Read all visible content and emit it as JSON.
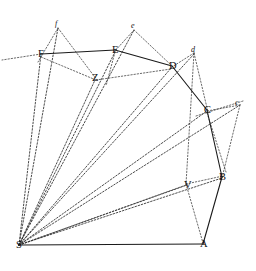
{
  "figure": {
    "width": 256,
    "height": 271,
    "background_color": "#ffffff",
    "stroke_color": "#1a1a1a"
  },
  "chart_data": {
    "type": "scatter",
    "title": "",
    "xlabel": "",
    "ylabel": "",
    "grid": false,
    "legend": "none",
    "xlim": [
      0,
      256
    ],
    "ylim": [
      0,
      271
    ],
    "note": "Planar geometric diagram: solid polygon S-A-B-C-D-E-F with dashed construction rays from apex S and auxiliary points Z, V and primed vertices c, d, e, f",
    "points": [
      {
        "label": "S",
        "case": "upper",
        "x": 19,
        "y": 245
      },
      {
        "label": "A",
        "case": "upper",
        "x": 203,
        "y": 244
      },
      {
        "label": "B",
        "case": "upper",
        "x": 222,
        "y": 177
      },
      {
        "label": "C",
        "case": "upper",
        "x": 207,
        "y": 110
      },
      {
        "label": "D",
        "case": "upper",
        "x": 172,
        "y": 66
      },
      {
        "label": "E",
        "case": "upper",
        "x": 115,
        "y": 50
      },
      {
        "label": "F",
        "case": "upper",
        "x": 41,
        "y": 54
      },
      {
        "label": "Z",
        "case": "upper",
        "x": 95,
        "y": 78
      },
      {
        "label": "V",
        "case": "upper",
        "x": 187,
        "y": 185
      },
      {
        "label": "c",
        "case": "lower",
        "x": 238,
        "y": 104
      },
      {
        "label": "d",
        "case": "lower",
        "x": 194,
        "y": 51
      },
      {
        "label": "e",
        "case": "lower",
        "x": 134,
        "y": 27
      },
      {
        "label": "f",
        "case": "lower",
        "x": 58,
        "y": 25
      }
    ],
    "solid_paths": [
      {
        "name": "base-S-A",
        "d": "M 19 245 L 203 244"
      },
      {
        "name": "edge-A-B",
        "d": "M 203 244 L 222 177"
      },
      {
        "name": "edge-B-C",
        "d": "M 222 177 L 207 110"
      },
      {
        "name": "edge-C-D",
        "d": "M 207 110 L 172 66"
      },
      {
        "name": "edge-D-E",
        "d": "M 172 66 L 115 50"
      },
      {
        "name": "edge-E-F",
        "d": "M 115 50 L 41 54"
      }
    ],
    "dashed_paths": [
      {
        "name": "ray-S-F",
        "d": "M 19 245 L 41 54"
      },
      {
        "name": "ray-S-f",
        "d": "M 19 245 L 58 28"
      },
      {
        "name": "ray-S-Z",
        "d": "M 19 245 L 95 80"
      },
      {
        "name": "ray-S-E",
        "d": "M 19 245 L 115 52"
      },
      {
        "name": "ray-S-e",
        "d": "M 19 245 L 134 30"
      },
      {
        "name": "ray-S-D",
        "d": "M 19 245 L 172 67"
      },
      {
        "name": "ray-S-d",
        "d": "M 19 245 L 194 54"
      },
      {
        "name": "ray-S-C",
        "d": "M 19 245 L 207 111"
      },
      {
        "name": "ray-S-c",
        "d": "M 19 245 L 240 105"
      },
      {
        "name": "ray-S-B",
        "d": "M 19 245 L 222 178"
      },
      {
        "name": "ray-S-V",
        "d": "M 19 245 L 187 185"
      },
      {
        "name": "chord-F-left",
        "d": "M 41 54 L 2 60"
      },
      {
        "name": "chord-f-F",
        "d": "M 58 28 L 38 62"
      },
      {
        "name": "chord-f-Z",
        "d": "M 58 28 L 97 80"
      },
      {
        "name": "chord-F-Z-right",
        "d": "M 41 57 L 96 80"
      },
      {
        "name": "chord-Z-D",
        "d": "M 96 80 L 171 69"
      },
      {
        "name": "chord-e-E",
        "d": "M 134 30 L 114 52"
      },
      {
        "name": "chord-e-D",
        "d": "M 134 30 L 171 65"
      },
      {
        "name": "chord-E-down",
        "d": "M 115 52 L 106 86"
      },
      {
        "name": "chord-d-D",
        "d": "M 194 53 L 172 67"
      },
      {
        "name": "chord-d-C",
        "d": "M 194 53 L 208 112"
      },
      {
        "name": "chord-d-V",
        "d": "M 194 53 L 186 184"
      },
      {
        "name": "chord-c-C",
        "d": "M 240 105 L 207 111"
      },
      {
        "name": "chord-c-B",
        "d": "M 240 105 L 222 178"
      },
      {
        "name": "chord-C-c-ext",
        "d": "M 196 116 L 243 101"
      },
      {
        "name": "chord-V-B",
        "d": "M 186 184 L 223 176"
      },
      {
        "name": "chord-V-A",
        "d": "M 186 184 L 203 243"
      },
      {
        "name": "chord-V-left",
        "d": "M 186 185 L 19 245"
      },
      {
        "name": "chord-C-V-B-low",
        "d": "M 207 113 L 226 172"
      }
    ]
  }
}
